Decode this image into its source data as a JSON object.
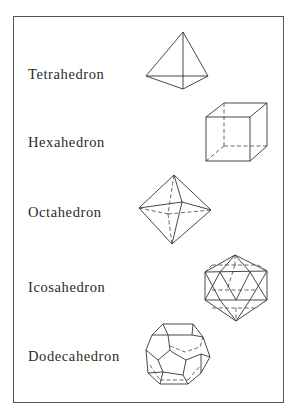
{
  "figure": {
    "items": [
      {
        "label": "Tetrahedron",
        "shape": "tetrahedron-icon"
      },
      {
        "label": "Hexahedron",
        "shape": "hexahedron-icon"
      },
      {
        "label": "Octahedron",
        "shape": "octahedron-icon"
      },
      {
        "label": "Icosahedron",
        "shape": "icosahedron-icon"
      },
      {
        "label": "Dodecahedron",
        "shape": "dodecahedron-icon"
      }
    ]
  }
}
